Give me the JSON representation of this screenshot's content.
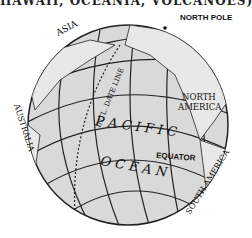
{
  "caption": "HAWAII, OCEANIA, VOLCANOES)",
  "labels": {
    "asia": "ASIA",
    "north_pole": "NORTH POLE",
    "north_america_1": "NORTH",
    "north_america_2": "AMERICA",
    "date_line": "INTL. DATE LINE",
    "australia": "AUSTRALIA",
    "pacific": "P A C I F I C",
    "ocean": "O C E A N",
    "equator": "EQUATOR",
    "south_america": "SOUTH AMERICA"
  },
  "colors": {
    "globe": "#d9d9d9",
    "lines": "#222222",
    "land": "#e8e8e8"
  }
}
